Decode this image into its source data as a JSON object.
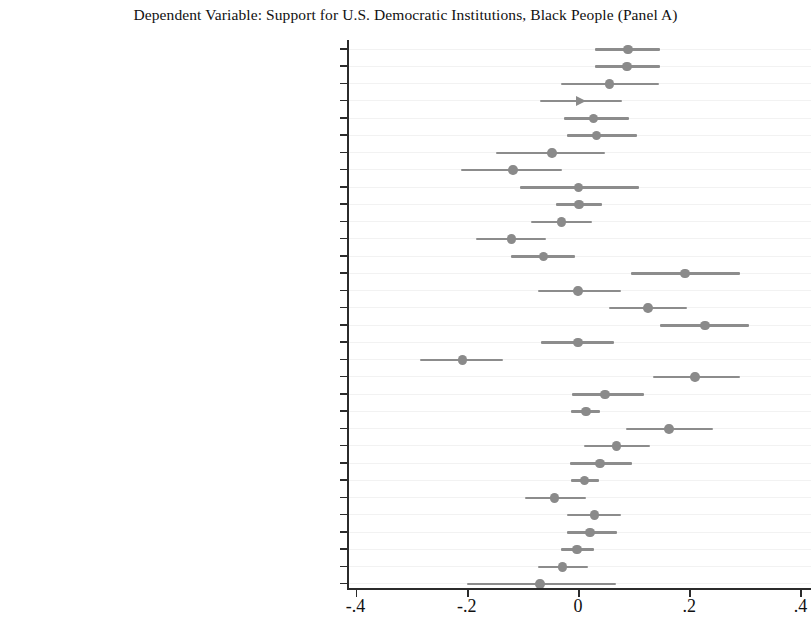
{
  "chart_data": {
    "type": "scatter",
    "title": "Dependent Variable: Support for U.S. Democratic Institutions, Black People (Panel A)",
    "subtitle": "",
    "xlabel": "",
    "ylabel": "",
    "xlim": [
      -0.42,
      0.42
    ],
    "grid": true,
    "legend": null,
    "zero_reference_line": 0,
    "xticks": [
      -0.4,
      -0.2,
      0,
      0.2,
      0.4
    ],
    "xticklabels": [
      "-.4",
      "-.2",
      "0",
      ".2",
      ".4"
    ],
    "point_color": "#8a8a8a",
    "interval_color": "#8c8c8c",
    "categories": [
      "Awareness of Barrett confirmation",
      "Evaluation of Barrett confirmation",
      "Awareness of Trump actions",
      "Evaluation of Trump actions",
      "Awareness of election controversy",
      "Election unfairness judgments",
      "Awareness of Capitol insurrection",
      "Capitol insurrection not harmful",
      "Awareness of Trump impeachment",
      "Trump impeachment not harmful",
      "Approval of no conviction for Trump",
      "Belief that Democrats threaten democracy",
      "Belief that Republicans threaten democracy",
      "Support for the rule of law",
      "Valuation of individual liberty",
      "Support for civil liberties",
      "Open-mindedness",
      "Authoritarianism",
      "Party identification",
      "Ideological identification",
      "Political knowledge",
      "Gender",
      "Age",
      "Level of education",
      "Income",
      "Homeownership",
      "Metropolitan residence",
      "Resident of the South",
      "Internet access",
      "Born-again",
      "Church attendance",
      "U.S. citizen"
    ],
    "estimates": [
      0.09,
      0.088,
      0.057,
      0.005,
      0.028,
      0.033,
      -0.047,
      -0.117,
      0.001,
      0.002,
      -0.03,
      -0.12,
      -0.062,
      0.192,
      0.0,
      0.126,
      0.228,
      0.0,
      -0.208,
      0.21,
      0.049,
      0.014,
      0.164,
      0.069,
      0.04,
      0.012,
      -0.042,
      0.03,
      0.022,
      -0.002,
      -0.028,
      -0.068
    ],
    "ci_low": [
      0.031,
      0.031,
      -0.03,
      -0.068,
      -0.026,
      -0.019,
      -0.148,
      -0.21,
      -0.105,
      -0.04,
      -0.085,
      -0.183,
      -0.12,
      0.095,
      -0.072,
      0.055,
      0.148,
      -0.066,
      -0.285,
      0.134,
      -0.01,
      -0.012,
      0.086,
      0.011,
      -0.014,
      -0.012,
      -0.095,
      -0.02,
      -0.02,
      -0.03,
      -0.072,
      -0.2
    ],
    "ci_high": [
      0.147,
      0.147,
      0.146,
      0.079,
      0.092,
      0.107,
      0.048,
      -0.028,
      0.11,
      0.044,
      0.026,
      -0.058,
      -0.005,
      0.292,
      0.078,
      0.196,
      0.308,
      0.065,
      -0.135,
      0.292,
      0.118,
      0.04,
      0.242,
      0.129,
      0.098,
      0.038,
      0.015,
      0.078,
      0.07,
      0.028,
      0.018,
      0.069
    ],
    "truncated_right": [
      false,
      false,
      false,
      true,
      false,
      false,
      false,
      false,
      false,
      false,
      false,
      false,
      false,
      false,
      false,
      false,
      false,
      false,
      false,
      false,
      false,
      false,
      false,
      false,
      false,
      false,
      false,
      false,
      false,
      false,
      false,
      false
    ]
  }
}
